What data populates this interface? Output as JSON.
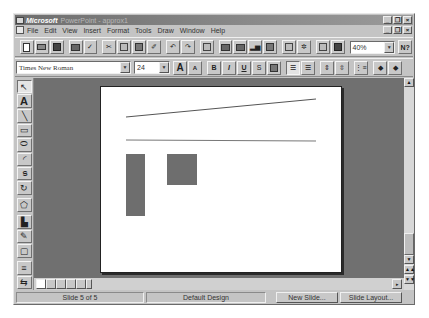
{
  "window": {
    "title_brand": "Microsoft",
    "title_rest": "PowerPoint - approx1",
    "controls": {
      "minimize": "_",
      "restore": "❐",
      "close": "×"
    }
  },
  "menubar": {
    "items": [
      {
        "label": "File",
        "key": "F",
        "rest": "ile"
      },
      {
        "label": "Edit",
        "key": "E",
        "rest": "dit"
      },
      {
        "label": "View",
        "key": "V",
        "rest": "iew"
      },
      {
        "label": "Insert",
        "key": "I",
        "rest": "nsert"
      },
      {
        "label": "Format",
        "key": "o",
        "pre": "F",
        "rest": "rmat"
      },
      {
        "label": "Tools",
        "key": "T",
        "rest": "ools"
      },
      {
        "label": "Draw",
        "key": "D",
        "rest": "raw"
      },
      {
        "label": "Window",
        "key": "W",
        "rest": "indow"
      },
      {
        "label": "Help",
        "key": "H",
        "rest": "elp"
      }
    ]
  },
  "standard_toolbar": {
    "buttons": [
      "new-icon",
      "open-icon",
      "save-icon",
      "print-icon",
      "spelling-icon",
      "cut-icon",
      "copy-icon",
      "paste-icon",
      "format-painter-icon",
      "undo-icon",
      "redo-icon",
      "insert-hyperlink-icon",
      "insert-word-table-icon",
      "insert-excel-worksheet-icon",
      "insert-chart-icon",
      "insert-clip-art-icon",
      "apply-design-icon",
      "new-slide-icon",
      "animation-effects-icon",
      "black-and-white-view-icon"
    ],
    "zoom_value": "40%",
    "help_label": "N?"
  },
  "formatting_toolbar": {
    "font_name": "Times New Roman",
    "font_size": "24",
    "increase_font_label": "A",
    "decrease_font_label": "A",
    "bold_label": "B",
    "italic_label": "I",
    "underline_label": "U",
    "shadow_label": "S",
    "buttons": [
      "text-color-icon",
      "align-left-icon",
      "center-icon",
      "increase-paragraph-spacing-icon",
      "decrease-paragraph-spacing-icon",
      "bullets-icon",
      "promote-icon",
      "demote-icon"
    ]
  },
  "drawing_toolbar": {
    "tools": [
      {
        "name": "select-arrow-icon",
        "glyph": "↖"
      },
      {
        "name": "text-tool-icon",
        "glyph": "A"
      },
      {
        "name": "line-tool-icon",
        "glyph": "╲"
      },
      {
        "name": "rectangle-tool-icon",
        "glyph": "▭"
      },
      {
        "name": "ellipse-tool-icon",
        "glyph": "⬭"
      },
      {
        "name": "arc-tool-icon",
        "glyph": "◜"
      },
      {
        "name": "freeform-tool-icon",
        "glyph": "ട"
      },
      {
        "name": "free-rotate-icon",
        "glyph": "↻"
      },
      {
        "name": "autoshapes-icon",
        "glyph": "⬠"
      },
      {
        "name": "fill-color-icon",
        "glyph": "▙"
      },
      {
        "name": "line-color-icon",
        "glyph": "✎"
      },
      {
        "name": "shadow-on-off-icon",
        "glyph": "▢"
      },
      {
        "name": "line-style-icon",
        "glyph": "≡"
      },
      {
        "name": "dash-style-icon",
        "glyph": "⇆"
      }
    ]
  },
  "slide": {
    "shapes": [
      {
        "type": "line",
        "x1": 25,
        "y1": 30,
        "x2": 215,
        "y2": 12,
        "color": "#555555"
      },
      {
        "type": "line",
        "x1": 25,
        "y1": 53,
        "x2": 215,
        "y2": 54,
        "color": "#777777"
      },
      {
        "type": "rect",
        "x": 25,
        "y": 67,
        "w": 19,
        "h": 62,
        "color": "#6e6e6e"
      },
      {
        "type": "rect",
        "x": 66,
        "y": 67,
        "w": 30,
        "h": 31,
        "color": "#6e6e6e"
      }
    ]
  },
  "view_buttons": [
    "slide-view-icon",
    "outline-view-icon",
    "slide-sorter-view-icon",
    "notes-page-view-icon",
    "slide-show-icon"
  ],
  "statusbar": {
    "slide_position": "Slide 5 of 5",
    "design": "Default Design",
    "new_slide_label": "New Slide...",
    "slide_layout_label": "Slide Layout..."
  }
}
